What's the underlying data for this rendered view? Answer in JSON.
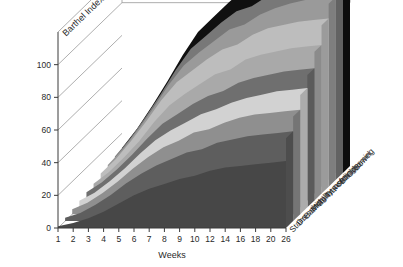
{
  "chart_data": {
    "type": "area",
    "title": "",
    "xlabel": "Weeks",
    "ylabel": "Barthel Index",
    "ylim": [
      0,
      120
    ],
    "ytick_labels": [
      "0",
      "20",
      "40",
      "60",
      "80",
      "100"
    ],
    "yticks": [
      0,
      20,
      40,
      60,
      80,
      100
    ],
    "grid": true,
    "legend_position": "right-depth-axis",
    "x": [
      1,
      2,
      3,
      4,
      5,
      6,
      7,
      8,
      9,
      10,
      12,
      14,
      16,
      18,
      20,
      26
    ],
    "xtick_labels": [
      "1",
      "2",
      "3",
      "4",
      "5",
      "6",
      "7",
      "8",
      "9",
      "10",
      "12",
      "14",
      "16",
      "18",
      "20",
      "26"
    ],
    "stacked": true,
    "series": [
      {
        "name": "Stairs",
        "color": "#474747",
        "values": [
          1,
          3,
          6,
          10,
          15,
          20,
          24,
          27,
          30,
          32,
          35,
          37,
          38,
          39,
          40,
          41
        ]
      },
      {
        "name": "Dressing",
        "color": "#5e5e5e",
        "values": [
          1,
          2,
          4,
          6,
          8,
          9,
          10,
          11,
          12,
          12,
          13,
          13,
          14,
          14,
          14,
          14
        ]
      },
      {
        "name": "Bathing",
        "color": "#8f8f8f",
        "values": [
          1,
          2,
          3,
          4,
          5,
          6,
          7,
          7,
          8,
          8,
          8,
          9,
          9,
          9,
          9,
          9
        ]
      },
      {
        "name": "Mobility",
        "color": "#d2d2d2",
        "values": [
          1,
          2,
          3,
          4,
          5,
          6,
          6,
          7,
          7,
          8,
          8,
          8,
          8,
          9,
          9,
          9
        ]
      },
      {
        "name": "Toilet use",
        "color": "#6f6f6f",
        "values": [
          1,
          2,
          3,
          4,
          5,
          6,
          6,
          7,
          7,
          7,
          8,
          8,
          8,
          8,
          8,
          8
        ]
      },
      {
        "name": "Transfer",
        "color": "#a9a9a9",
        "values": [
          1,
          2,
          3,
          4,
          6,
          7,
          8,
          8,
          9,
          9,
          10,
          10,
          10,
          10,
          10,
          10
        ]
      },
      {
        "name": "Feeding",
        "color": "#bdbdbd",
        "values": [
          2,
          4,
          6,
          8,
          9,
          10,
          10,
          11,
          11,
          11,
          11,
          12,
          12,
          12,
          12,
          12
        ]
      },
      {
        "name": "Bladder",
        "color": "#9a9a9a",
        "values": [
          1,
          2,
          3,
          4,
          5,
          6,
          7,
          7,
          8,
          8,
          8,
          8,
          9,
          9,
          9,
          9
        ]
      },
      {
        "name": "Grooming",
        "color": "#787878",
        "values": [
          1,
          2,
          3,
          4,
          5,
          6,
          6,
          7,
          7,
          7,
          7,
          8,
          8,
          8,
          8,
          8
        ]
      },
      {
        "name": "Bowel",
        "color": "#101010",
        "values": [
          1,
          2,
          3,
          4,
          5,
          6,
          7,
          8,
          9,
          9,
          10,
          10,
          10,
          10,
          10,
          10
        ]
      }
    ]
  },
  "axes": {
    "y_title": "Barthel Index",
    "x_title": "Weeks"
  }
}
